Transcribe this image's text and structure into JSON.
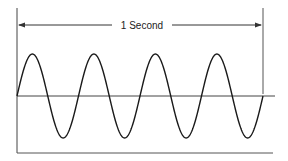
{
  "diagram": {
    "type": "sine-wave-frequency",
    "label": "1 Second",
    "cycles": 4,
    "colors": {
      "line": "#333333",
      "wave": "#1a1a1a",
      "background": "#ffffff"
    }
  }
}
